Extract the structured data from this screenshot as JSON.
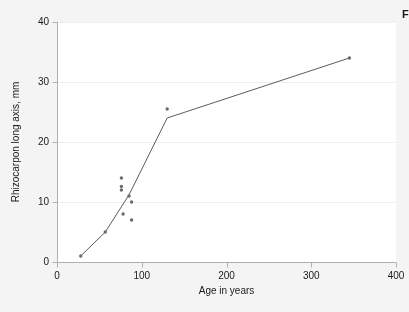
{
  "figure": {
    "corner_text": "F",
    "background_color": "#f4f4f4",
    "plot_background_color": "#ffffff",
    "axis_color": "#b0b0b0",
    "grid_color": "#efefef",
    "marker_color": "#666a72",
    "line_color": "#4a4a50",
    "tick_label_color": "#1a1a1a"
  },
  "chart_data": {
    "type": "scatter",
    "title": "",
    "subtitle": "",
    "xlabel": "Age in years",
    "ylabel": "Rhizocarpon long axis, mm",
    "xlim": [
      0,
      400
    ],
    "ylim": [
      0,
      40
    ],
    "xticks": [
      0,
      100,
      200,
      300,
      400
    ],
    "yticks": [
      0,
      10,
      20,
      30,
      40
    ],
    "xtick_labels": [
      "0",
      "100",
      "200",
      "300",
      "400"
    ],
    "ytick_labels": [
      "0",
      "10",
      "20",
      "30",
      "40"
    ],
    "grid": "horizontal-only",
    "legend": "none",
    "annotations": [],
    "series": [
      {
        "name": "Lichen measurements",
        "type": "scatter",
        "marker": "circle",
        "points": [
          {
            "x": 28,
            "y": 1.0
          },
          {
            "x": 57,
            "y": 5.0
          },
          {
            "x": 76,
            "y": 14.0
          },
          {
            "x": 76,
            "y": 12.6
          },
          {
            "x": 76,
            "y": 12.0
          },
          {
            "x": 78,
            "y": 8.0
          },
          {
            "x": 85,
            "y": 11.0
          },
          {
            "x": 88,
            "y": 10.0
          },
          {
            "x": 88,
            "y": 7.0
          },
          {
            "x": 130,
            "y": 25.5
          },
          {
            "x": 345,
            "y": 34.0
          }
        ]
      },
      {
        "name": "Lichen growth curve",
        "type": "line",
        "points": [
          {
            "x": 28,
            "y": 1.0
          },
          {
            "x": 57,
            "y": 5.0
          },
          {
            "x": 85,
            "y": 11.2
          },
          {
            "x": 130,
            "y": 24.0
          },
          {
            "x": 345,
            "y": 34.0
          }
        ]
      }
    ]
  }
}
